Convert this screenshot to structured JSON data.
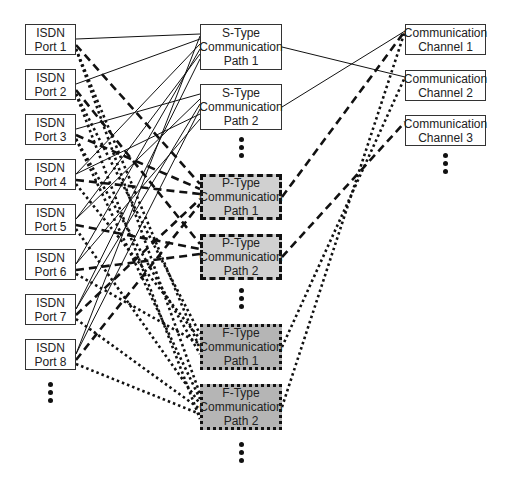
{
  "diagram": {
    "ports": [
      {
        "id": "port1",
        "label": "ISDN\nPort 1"
      },
      {
        "id": "port2",
        "label": "ISDN\nPort 2"
      },
      {
        "id": "port3",
        "label": "ISDN\nPort 3"
      },
      {
        "id": "port4",
        "label": "ISDN\nPort 4"
      },
      {
        "id": "port5",
        "label": "ISDN\nPort 5"
      },
      {
        "id": "port6",
        "label": "ISDN\nPort 6"
      },
      {
        "id": "port7",
        "label": "ISDN\nPort 7"
      },
      {
        "id": "port8",
        "label": "ISDN\nPort 8"
      }
    ],
    "paths": [
      {
        "id": "s1",
        "type": "S",
        "label": "S-Type\nCommunication\nPath 1"
      },
      {
        "id": "s2",
        "type": "S",
        "label": "S-Type\nCommunication\nPath 2"
      },
      {
        "id": "p1",
        "type": "P",
        "label": "P-Type\nCommunication\nPath 1"
      },
      {
        "id": "p2",
        "type": "P",
        "label": "P-Type\nCommunication\nPath 2"
      },
      {
        "id": "f1",
        "type": "F",
        "label": "F-Type\nCommunication\nPath 1"
      },
      {
        "id": "f2",
        "type": "F",
        "label": "F-Type\nCommunication\nPath 2"
      }
    ],
    "channels": [
      {
        "id": "c1",
        "label": "Communication\nChannel 1"
      },
      {
        "id": "c2",
        "label": "Communication\nChannel 2"
      },
      {
        "id": "c3",
        "label": "Communication\nChannel 3"
      }
    ],
    "line_styles": {
      "S": "solid",
      "P": "dashed",
      "F": "dotted"
    },
    "connections": {
      "port_to_S": [
        [
          "port1",
          "s1"
        ],
        [
          "port2",
          "s1"
        ],
        [
          "port3",
          "s2"
        ],
        [
          "port4",
          "s1"
        ],
        [
          "port5",
          "s2"
        ],
        [
          "port6",
          "s1"
        ],
        [
          "port7",
          "s2"
        ],
        [
          "port8",
          "s2"
        ],
        [
          "port4",
          "s2"
        ],
        [
          "port5",
          "s1"
        ],
        [
          "port6",
          "s2"
        ],
        [
          "port7",
          "s1"
        ],
        [
          "port8",
          "s1"
        ]
      ],
      "port_to_P": [
        [
          "port1",
          "p1"
        ],
        [
          "port2",
          "p2"
        ],
        [
          "port3",
          "p1"
        ],
        [
          "port4",
          "p1"
        ],
        [
          "port5",
          "p2"
        ],
        [
          "port6",
          "p2"
        ],
        [
          "port7",
          "p1"
        ],
        [
          "port8",
          "p1"
        ]
      ],
      "port_to_F": [
        [
          "port1",
          "f2"
        ],
        [
          "port2",
          "f1"
        ],
        [
          "port3",
          "f2"
        ],
        [
          "port4",
          "f1"
        ],
        [
          "port5",
          "f2"
        ],
        [
          "port6",
          "f1"
        ],
        [
          "port7",
          "f2"
        ],
        [
          "port8",
          "f2"
        ],
        [
          "port1",
          "f1"
        ],
        [
          "port2",
          "f2"
        ],
        [
          "port3",
          "f1"
        ]
      ],
      "path_to_channel": [
        [
          "s1",
          "c2"
        ],
        [
          "s2",
          "c1"
        ],
        [
          "p1",
          "c1"
        ],
        [
          "p2",
          "c3"
        ],
        [
          "f1",
          "c2"
        ],
        [
          "f2",
          "c1"
        ]
      ]
    },
    "colors": {
      "line": "#111111",
      "border": "#333333",
      "p_fill": "#d0d0d0",
      "f_fill": "#b5b5b5"
    }
  }
}
